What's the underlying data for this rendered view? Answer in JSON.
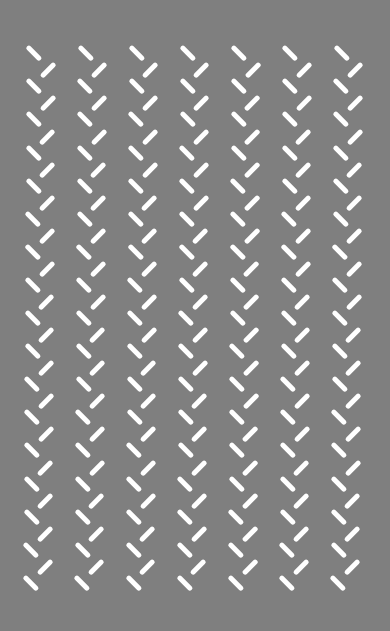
{
  "image": {
    "kind": "optical-illusion-pattern",
    "description": "Zigzag columns of short white dashes on a gray field",
    "width": 390,
    "height": 631,
    "colors": {
      "background": "#7f7f7f",
      "dash": "#ffffff"
    }
  },
  "pattern": {
    "columns": 7,
    "column_center_x_start": 34.3,
    "column_spacing_x": 51.2,
    "rows_backslash": 17,
    "rows_slash": 16,
    "row_center_y_start": 53.2,
    "row_spacing_y": 33.1,
    "slash_offset": {
      "dx": 13.4,
      "dy": 17.1
    },
    "drift_x_per_row": -0.2,
    "dash": {
      "length": 19,
      "thickness": 4.6,
      "angle_backslash_deg": 45,
      "angle_slash_deg": -45
    },
    "icons": {
      "backslash_dash": "backslash-dash-icon",
      "slash_dash": "slash-dash-icon"
    }
  }
}
